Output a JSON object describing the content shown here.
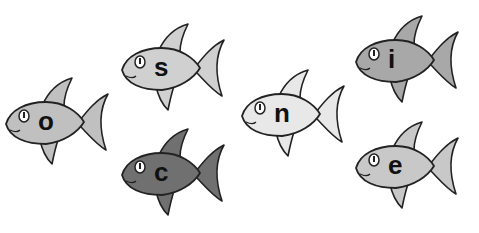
{
  "fish": [
    {
      "letter": "o",
      "x": 2,
      "y": 74,
      "color": "#c0c0c0"
    },
    {
      "letter": "s",
      "x": 118,
      "y": 20,
      "color": "#d0d0d0"
    },
    {
      "letter": "c",
      "x": 118,
      "y": 125,
      "color": "#707070"
    },
    {
      "letter": "n",
      "x": 238,
      "y": 66,
      "color": "#e8e8e8"
    },
    {
      "letter": "i",
      "x": 352,
      "y": 12,
      "color": "#a8a8a8"
    },
    {
      "letter": "e",
      "x": 352,
      "y": 118,
      "color": "#c8c8c8"
    }
  ]
}
